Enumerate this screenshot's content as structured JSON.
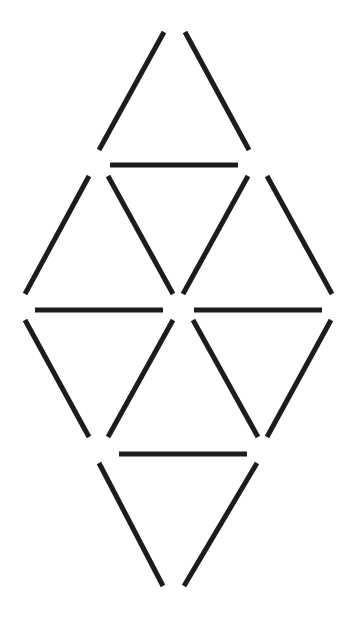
{
  "diagram": {
    "stroke_color": "#1c1c1c",
    "background": "#ffffff",
    "stick_count": 16,
    "sticks": [
      {
        "id": "s1",
        "x1": 164,
        "y1": 32,
        "x2": 99,
        "y2": 150
      },
      {
        "id": "s2",
        "x1": 185,
        "y1": 32,
        "x2": 249,
        "y2": 150
      },
      {
        "id": "s3",
        "x1": 110,
        "y1": 165,
        "x2": 238,
        "y2": 165
      },
      {
        "id": "s4",
        "x1": 89,
        "y1": 176,
        "x2": 25,
        "y2": 294
      },
      {
        "id": "s5",
        "x1": 108,
        "y1": 176,
        "x2": 173,
        "y2": 294
      },
      {
        "id": "s6",
        "x1": 248,
        "y1": 176,
        "x2": 183,
        "y2": 294
      },
      {
        "id": "s7",
        "x1": 267,
        "y1": 176,
        "x2": 332,
        "y2": 294
      },
      {
        "id": "s8",
        "x1": 35,
        "y1": 310,
        "x2": 163,
        "y2": 310
      },
      {
        "id": "s9",
        "x1": 194,
        "y1": 310,
        "x2": 322,
        "y2": 310
      },
      {
        "id": "s10",
        "x1": 25,
        "y1": 320,
        "x2": 89,
        "y2": 437
      },
      {
        "id": "s11",
        "x1": 173,
        "y1": 320,
        "x2": 108,
        "y2": 437
      },
      {
        "id": "s12",
        "x1": 193,
        "y1": 320,
        "x2": 258,
        "y2": 437
      },
      {
        "id": "s13",
        "x1": 331,
        "y1": 320,
        "x2": 267,
        "y2": 437
      },
      {
        "id": "s14",
        "x1": 119,
        "y1": 454,
        "x2": 247,
        "y2": 454
      },
      {
        "id": "s15",
        "x1": 99,
        "y1": 463,
        "x2": 163,
        "y2": 586
      },
      {
        "id": "s16",
        "x1": 257,
        "y1": 463,
        "x2": 184,
        "y2": 586
      }
    ]
  }
}
